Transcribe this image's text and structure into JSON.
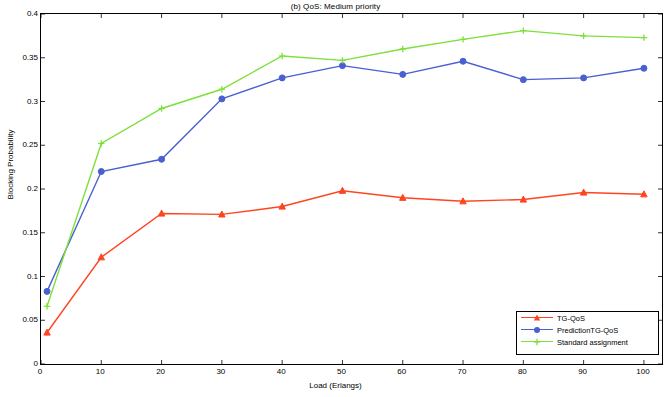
{
  "chart_data": {
    "type": "line",
    "title": "(b) QoS: Medium priority",
    "xlabel": "Load (Erlangs)",
    "ylabel": "Blocking Probability",
    "xlim": [
      0,
      103
    ],
    "ylim": [
      0,
      0.4
    ],
    "xticks": [
      0,
      10,
      20,
      30,
      40,
      50,
      60,
      70,
      80,
      90,
      100
    ],
    "xticklabels": [
      "0",
      "10",
      "20",
      "30",
      "40",
      "50",
      "60",
      "70",
      "80",
      "90",
      "100"
    ],
    "yticks": [
      0,
      0.05,
      0.1,
      0.15,
      0.2,
      0.25,
      0.3,
      0.35,
      0.4
    ],
    "yticklabels": [
      "0",
      "0.05",
      "0.1",
      "0.15",
      "0.2",
      "0.25",
      "0.3",
      "0.35",
      "0.4"
    ],
    "grid": false,
    "legend_position": "lower-right",
    "x": [
      1,
      10,
      20,
      30,
      40,
      50,
      60,
      70,
      80,
      90,
      100
    ],
    "series": [
      {
        "name": "TG-QoS",
        "color": "#ff4422",
        "marker": "triangle",
        "values": [
          0.036,
          0.122,
          0.172,
          0.171,
          0.18,
          0.198,
          0.19,
          0.186,
          0.188,
          0.196,
          0.194
        ]
      },
      {
        "name": "PredictionTG-QoS",
        "color": "#4a5fd0",
        "marker": "circle",
        "values": [
          0.083,
          0.22,
          0.234,
          0.303,
          0.327,
          0.341,
          0.331,
          0.346,
          0.325,
          0.327,
          0.338
        ]
      },
      {
        "name": "Standard assignment",
        "color": "#7ee03a",
        "marker": "plus",
        "values": [
          0.066,
          0.252,
          0.292,
          0.314,
          0.352,
          0.347,
          0.36,
          0.371,
          0.381,
          0.375,
          0.373
        ]
      }
    ]
  },
  "legend": {
    "items": [
      {
        "label": "TG-QoS"
      },
      {
        "label": "PredictionTG-QoS"
      },
      {
        "label": "Standard assignment"
      }
    ]
  }
}
